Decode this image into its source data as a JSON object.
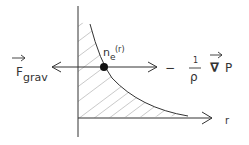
{
  "diagram": {
    "labels": {
      "fgrav_main": "F",
      "fgrav_sub": "grav",
      "density_main": "n",
      "density_sub": "e",
      "density_arg": "(r)",
      "minus": "−",
      "fraction_num": "1",
      "fraction_den": "ρ",
      "nabla": "∇",
      "pressure": "P",
      "r_axis": "r"
    },
    "colors": {
      "ink": "#333333",
      "hatch": "#bbbbbb",
      "background": "#ffffff"
    }
  }
}
